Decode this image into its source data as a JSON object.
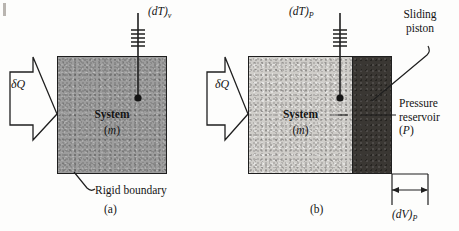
{
  "figure": {
    "background_color": "#fdfdfc",
    "ink_color": "#1f1f1f"
  },
  "panel_a": {
    "caption": "(a)",
    "heat_label": "δQ",
    "probe_label_main": "(dT)",
    "probe_label_sub": "v",
    "system_label": "System",
    "mass_label": "(m)",
    "mass_symbol": "m",
    "boundary_label": "Rigid boundary",
    "fill_color": "#9d9d9d"
  },
  "panel_b": {
    "caption": "(b)",
    "heat_label": "δQ",
    "probe_label_main": "(dT)",
    "probe_label_sub": "P",
    "system_label": "System",
    "mass_label": "(m)",
    "mass_symbol": "m",
    "piston_label_line1": "Sliding",
    "piston_label_line2": "piston",
    "reservoir_label_line1": "Pressure",
    "reservoir_label_line2": "reservoir",
    "reservoir_label_line3": "(P)",
    "reservoir_symbol": "P",
    "volume_change_main": "(dV)",
    "volume_change_sub": "P",
    "fill_color": "#cfcdc9",
    "piston_color": "#3a3733"
  }
}
